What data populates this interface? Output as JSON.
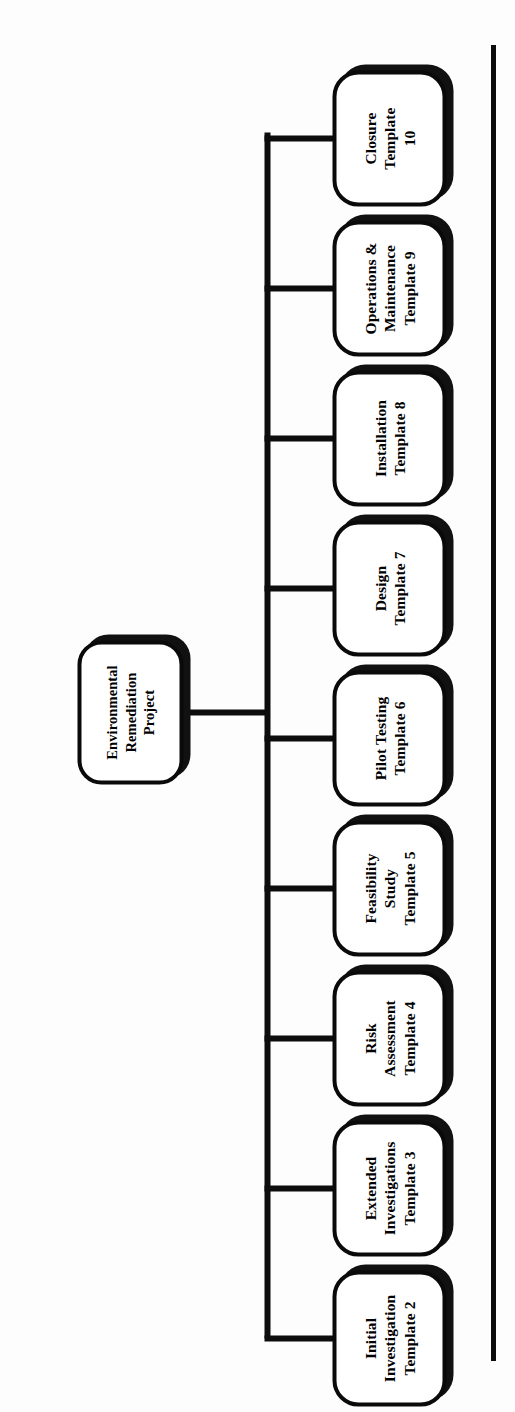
{
  "document": {
    "type": "flow-diagram",
    "orientation": "landscape-rotated-90-ccw",
    "page_rule": "vertical-margin-rule"
  },
  "diagram": {
    "root": {
      "id": "environmental-remediation-project",
      "label": "Environmental\nRemediation\nProject"
    },
    "children": [
      {
        "id": "initial-investigation",
        "label": "Initial\nInvestigation\nTemplate 2"
      },
      {
        "id": "extended-investigations",
        "label": "Extended\nInvestigations\nTemplate 3"
      },
      {
        "id": "risk-assessment",
        "label": "Risk\nAssessment\nTemplate 4"
      },
      {
        "id": "feasibility-study",
        "label": "Feasibility\nStudy\nTemplate 5"
      },
      {
        "id": "pilot-testing",
        "label": "Pilot Testing\nTemplate 6"
      },
      {
        "id": "design",
        "label": "Design\nTemplate 7"
      },
      {
        "id": "installation",
        "label": "Installation\nTemplate 8"
      },
      {
        "id": "operations-maintenance",
        "label": "Operations &\nMaintenance\nTemplate 9"
      },
      {
        "id": "closure",
        "label": "Closure\nTemplate\n10"
      }
    ]
  },
  "colors": {
    "ink": "#000000",
    "line": "#0d0d0d",
    "paper": "#ffffff",
    "shadow": "#111111"
  }
}
